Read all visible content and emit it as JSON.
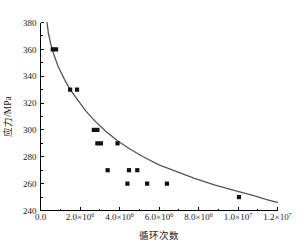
{
  "chart_data": {
    "type": "scatter",
    "title": "",
    "subtitle": "",
    "xlabel": "循环次数",
    "ylabel": "应力/MPa",
    "xlim": [
      0,
      12000000
    ],
    "ylim": [
      240,
      380
    ],
    "grid": false,
    "legend": null,
    "x_ticks": [
      {
        "value": 0,
        "mantissa": "0.0",
        "exponent": "",
        "label": "0.0"
      },
      {
        "value": 2000000,
        "mantissa": "2.0×10",
        "exponent": "6",
        "label": "2.0×10^6"
      },
      {
        "value": 4000000,
        "mantissa": "4.0×10",
        "exponent": "6",
        "label": "4.0×10^6"
      },
      {
        "value": 6000000,
        "mantissa": "6.0×10",
        "exponent": "6",
        "label": "6.0×10^6"
      },
      {
        "value": 8000000,
        "mantissa": "8.0×10",
        "exponent": "6",
        "label": "8.0×10^6"
      },
      {
        "value": 10000000,
        "mantissa": "1.0×10",
        "exponent": "7",
        "label": "1.0×10^7"
      },
      {
        "value": 12000000,
        "mantissa": "1.2×10",
        "exponent": "7",
        "label": "1.2×10^7"
      }
    ],
    "y_ticks": [
      {
        "value": 240,
        "label": "240"
      },
      {
        "value": 260,
        "label": "260"
      },
      {
        "value": 280,
        "label": "280"
      },
      {
        "value": 300,
        "label": "300"
      },
      {
        "value": 320,
        "label": "320"
      },
      {
        "value": 340,
        "label": "340"
      },
      {
        "value": 360,
        "label": "360"
      },
      {
        "value": 380,
        "label": "380"
      }
    ],
    "series": [
      {
        "name": "fatigue-data",
        "marker": "square",
        "color": "#111111",
        "points": [
          {
            "x": 620000,
            "y": 360
          },
          {
            "x": 790000,
            "y": 360
          },
          {
            "x": 1500000,
            "y": 330
          },
          {
            "x": 1850000,
            "y": 330
          },
          {
            "x": 2700000,
            "y": 300
          },
          {
            "x": 2880000,
            "y": 300
          },
          {
            "x": 2880000,
            "y": 290
          },
          {
            "x": 3060000,
            "y": 290
          },
          {
            "x": 3900000,
            "y": 290
          },
          {
            "x": 3400000,
            "y": 270
          },
          {
            "x": 4480000,
            "y": 270
          },
          {
            "x": 4900000,
            "y": 270
          },
          {
            "x": 4400000,
            "y": 260
          },
          {
            "x": 5400000,
            "y": 260
          },
          {
            "x": 6400000,
            "y": 260
          },
          {
            "x": 10050000,
            "y": 250
          }
        ]
      }
    ],
    "fit_curve": {
      "name": "power-law-fit",
      "color": "#555555",
      "model": "S = a * N^-b",
      "points": [
        {
          "x": 330000,
          "y": 380
        },
        {
          "x": 400000,
          "y": 372
        },
        {
          "x": 520000,
          "y": 364
        },
        {
          "x": 700000,
          "y": 355
        },
        {
          "x": 900000,
          "y": 347
        },
        {
          "x": 1200000,
          "y": 338
        },
        {
          "x": 1500000,
          "y": 330
        },
        {
          "x": 1900000,
          "y": 322
        },
        {
          "x": 2300000,
          "y": 314
        },
        {
          "x": 2800000,
          "y": 306
        },
        {
          "x": 3300000,
          "y": 299
        },
        {
          "x": 3900000,
          "y": 292
        },
        {
          "x": 4500000,
          "y": 286
        },
        {
          "x": 5200000,
          "y": 280
        },
        {
          "x": 6000000,
          "y": 274
        },
        {
          "x": 6900000,
          "y": 269
        },
        {
          "x": 7800000,
          "y": 264
        },
        {
          "x": 8800000,
          "y": 259
        },
        {
          "x": 9800000,
          "y": 255
        },
        {
          "x": 10800000,
          "y": 251
        },
        {
          "x": 11500000,
          "y": 248
        },
        {
          "x": 12000000,
          "y": 246
        }
      ]
    }
  }
}
